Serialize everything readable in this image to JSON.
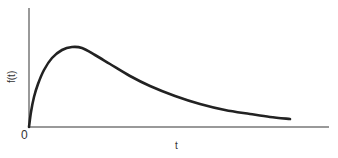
{
  "chart_data": {
    "type": "line",
    "title": "",
    "xlabel": "t",
    "ylabel": "f(t)",
    "origin_label": "0",
    "grid": false,
    "legend": null,
    "series": [
      {
        "name": "f(t)",
        "color": "#222222",
        "points_px": [
          [
            29,
            127
          ],
          [
            31,
            112
          ],
          [
            34,
            97
          ],
          [
            38,
            84
          ],
          [
            44,
            70
          ],
          [
            52,
            58
          ],
          [
            62,
            50
          ],
          [
            72,
            47
          ],
          [
            82,
            48
          ],
          [
            95,
            55
          ],
          [
            110,
            64
          ],
          [
            130,
            76
          ],
          [
            150,
            86
          ],
          [
            175,
            96
          ],
          [
            200,
            104
          ],
          [
            225,
            110
          ],
          [
            250,
            114
          ],
          [
            270,
            117
          ],
          [
            290,
            119
          ]
        ]
      }
    ],
    "axes": {
      "x_axis": {
        "x1": 29,
        "x2": 329,
        "y": 127
      },
      "y_axis": {
        "x": 29,
        "y1": 8,
        "y2": 127
      },
      "color": "#777777"
    }
  }
}
